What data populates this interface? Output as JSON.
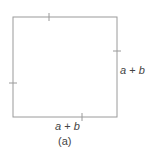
{
  "diagram": {
    "shape": "square",
    "line_color": "#9a9a9a",
    "text_color": "#444444",
    "square": {
      "x": 13,
      "y": 17,
      "width": 104,
      "height": 100
    },
    "ticks": [
      {
        "side": "top",
        "position": 49
      },
      {
        "side": "right",
        "position": 51
      },
      {
        "side": "left",
        "position": 83
      },
      {
        "side": "bottom",
        "position": 82
      }
    ],
    "labels": {
      "right": {
        "var_a": "a",
        "op": "+",
        "var_b": "b"
      },
      "bottom": {
        "var_a": "a",
        "op": "+",
        "var_b": "b"
      }
    },
    "caption": "(a)"
  }
}
